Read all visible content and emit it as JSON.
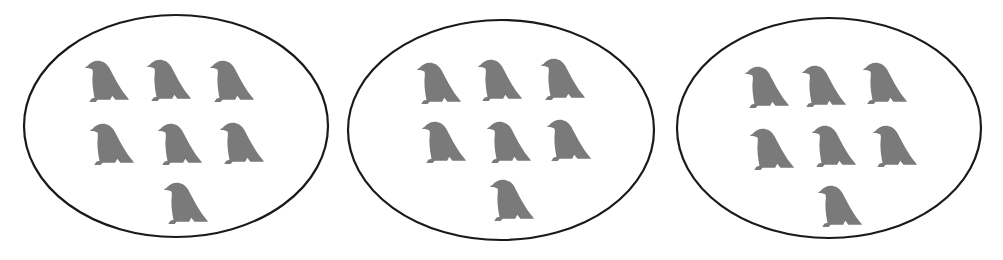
{
  "figure": {
    "colors": {
      "bird": "#7a7a7a",
      "outline": "#1a1a1a",
      "background": "#ffffff"
    },
    "groups": [
      {
        "name": "group-1",
        "count": 7,
        "ellipse": {
          "cx": 176,
          "cy": 126,
          "rx": 152,
          "ry": 111
        },
        "birds": [
          {
            "x": 83,
            "y": 58
          },
          {
            "x": 145,
            "y": 57
          },
          {
            "x": 208,
            "y": 58
          },
          {
            "x": 88,
            "y": 121
          },
          {
            "x": 156,
            "y": 121
          },
          {
            "x": 218,
            "y": 120
          },
          {
            "x": 162,
            "y": 180
          }
        ]
      },
      {
        "name": "group-2",
        "count": 7,
        "ellipse": {
          "cx": 501,
          "cy": 130,
          "rx": 153,
          "ry": 110
        },
        "birds": [
          {
            "x": 415,
            "y": 60
          },
          {
            "x": 476,
            "y": 57
          },
          {
            "x": 539,
            "y": 56
          },
          {
            "x": 420,
            "y": 119
          },
          {
            "x": 485,
            "y": 119
          },
          {
            "x": 545,
            "y": 117
          },
          {
            "x": 488,
            "y": 177
          }
        ]
      },
      {
        "name": "group-3",
        "count": 7,
        "ellipse": {
          "cx": 829,
          "cy": 128,
          "rx": 152,
          "ry": 110
        },
        "birds": [
          {
            "x": 743,
            "y": 64
          },
          {
            "x": 800,
            "y": 63
          },
          {
            "x": 861,
            "y": 60
          },
          {
            "x": 748,
            "y": 126
          },
          {
            "x": 810,
            "y": 123
          },
          {
            "x": 871,
            "y": 123
          },
          {
            "x": 816,
            "y": 183
          }
        ]
      }
    ]
  }
}
